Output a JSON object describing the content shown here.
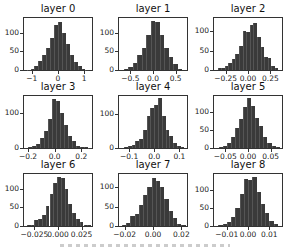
{
  "figure": {
    "layout": "3x3 grid of histograms",
    "bar_color": "#3a3a3a"
  },
  "chart_data": [
    {
      "type": "bar",
      "title": "layer 0",
      "xticks": [
        "−1",
        "0",
        "1"
      ],
      "xtick_values": [
        -1,
        0,
        1
      ],
      "xlim": [
        -1.3,
        1.3
      ],
      "yticks": [
        "0",
        "50",
        "100"
      ],
      "ytick_values": [
        0,
        50,
        100
      ],
      "ylim": [
        0,
        140
      ],
      "bins": [
        -1.2,
        -1.05,
        -0.9,
        -0.75,
        -0.6,
        -0.45,
        -0.3,
        -0.15,
        0.0,
        0.15,
        0.3,
        0.45,
        0.6,
        0.75,
        0.9,
        1.05
      ],
      "values": [
        1,
        4,
        10,
        25,
        40,
        60,
        85,
        122,
        128,
        100,
        70,
        40,
        22,
        10,
        4,
        1
      ]
    },
    {
      "type": "bar",
      "title": "layer 1",
      "xticks": [
        "−0.5",
        "0.0",
        "0.5"
      ],
      "xtick_values": [
        -0.5,
        0,
        0.5
      ],
      "xlim": [
        -0.75,
        0.75
      ],
      "yticks": [
        "0",
        "50",
        "100"
      ],
      "ytick_values": [
        0,
        50,
        100
      ],
      "ylim": [
        0,
        140
      ],
      "bins": [
        -0.65,
        -0.55,
        -0.45,
        -0.35,
        -0.25,
        -0.15,
        -0.05,
        0.05,
        0.15,
        0.25,
        0.35,
        0.45,
        0.55
      ],
      "values": [
        3,
        8,
        20,
        40,
        60,
        95,
        132,
        130,
        95,
        60,
        35,
        15,
        4
      ]
    },
    {
      "type": "bar",
      "title": "layer 2",
      "xticks": [
        "−0.25",
        "0.00",
        "0.25"
      ],
      "xtick_values": [
        -0.25,
        0,
        0.25
      ],
      "xlim": [
        -0.38,
        0.38
      ],
      "yticks": [
        "0",
        "50",
        "100"
      ],
      "ytick_values": [
        0,
        50,
        100
      ],
      "ylim": [
        0,
        135
      ],
      "bins": [
        -0.34,
        -0.3,
        -0.26,
        -0.22,
        -0.18,
        -0.14,
        -0.1,
        -0.06,
        -0.02,
        0.02,
        0.06,
        0.1,
        0.14,
        0.18,
        0.22,
        0.26,
        0.3
      ],
      "values": [
        5,
        6,
        10,
        18,
        28,
        42,
        62,
        100,
        98,
        118,
        122,
        85,
        60,
        35,
        30,
        10,
        4
      ]
    },
    {
      "type": "bar",
      "title": "layer 3",
      "xticks": [
        "−0.2",
        "0.0",
        "0.2"
      ],
      "xtick_values": [
        -0.2,
        0,
        0.2
      ],
      "xlim": [
        -0.23,
        0.28
      ],
      "yticks": [
        "0",
        "100"
      ],
      "ytick_values": [
        0,
        100
      ],
      "ylim": [
        0,
        150
      ],
      "bins": [
        -0.2,
        -0.17,
        -0.14,
        -0.11,
        -0.08,
        -0.05,
        -0.02,
        0.01,
        0.04,
        0.07,
        0.1,
        0.13,
        0.16,
        0.19,
        0.22,
        0.25
      ],
      "values": [
        3,
        5,
        12,
        30,
        50,
        85,
        140,
        135,
        100,
        65,
        35,
        20,
        6,
        2,
        3,
        1
      ]
    },
    {
      "type": "bar",
      "title": "layer 4",
      "xticks": [
        "−0.1",
        "0.0",
        "0.1"
      ],
      "xtick_values": [
        -0.1,
        0,
        0.1
      ],
      "xlim": [
        -0.14,
        0.13
      ],
      "yticks": [
        "0",
        "100"
      ],
      "ytick_values": [
        0,
        100
      ],
      "ylim": [
        0,
        155
      ],
      "bins": [
        -0.12,
        -0.105,
        -0.09,
        -0.075,
        -0.06,
        -0.045,
        -0.03,
        -0.015,
        0.0,
        0.015,
        0.03,
        0.045,
        0.06,
        0.075,
        0.09,
        0.105
      ],
      "values": [
        2,
        5,
        10,
        20,
        28,
        55,
        95,
        120,
        128,
        150,
        95,
        55,
        35,
        15,
        5,
        2
      ]
    },
    {
      "type": "bar",
      "title": "layer 5",
      "xticks": [
        "−0.05",
        "0.00",
        "0.05"
      ],
      "xtick_values": [
        -0.05,
        0,
        0.05
      ],
      "xlim": [
        -0.075,
        0.075
      ],
      "yticks": [
        "0",
        "50",
        "100"
      ],
      "ytick_values": [
        0,
        50,
        100
      ],
      "ylim": [
        0,
        145
      ],
      "bins": [
        -0.065,
        -0.056,
        -0.047,
        -0.038,
        -0.029,
        -0.02,
        -0.011,
        -0.002,
        0.007,
        0.016,
        0.025,
        0.034,
        0.043,
        0.052,
        0.061
      ],
      "values": [
        2,
        6,
        14,
        30,
        55,
        80,
        115,
        140,
        118,
        85,
        60,
        32,
        15,
        5,
        2
      ]
    },
    {
      "type": "bar",
      "title": "layer 6",
      "xticks": [
        "−0.025",
        "0.000",
        "0.025"
      ],
      "xtick_values": [
        -0.025,
        0,
        0.025
      ],
      "xlim": [
        -0.036,
        0.036
      ],
      "yticks": [
        "0",
        "50",
        "100"
      ],
      "ytick_values": [
        0,
        50,
        100
      ],
      "ylim": [
        0,
        140
      ],
      "bins": [
        -0.033,
        -0.029,
        -0.025,
        -0.021,
        -0.017,
        -0.013,
        -0.009,
        -0.005,
        -0.001,
        0.003,
        0.007,
        0.011,
        0.015,
        0.019,
        0.023,
        0.027,
        0.031
      ],
      "values": [
        2,
        3,
        15,
        18,
        30,
        55,
        85,
        115,
        132,
        128,
        100,
        60,
        35,
        20,
        10,
        3,
        2
      ]
    },
    {
      "type": "bar",
      "title": "layer 7",
      "xticks": [
        "−0.02",
        "0.00",
        "0.02"
      ],
      "xtick_values": [
        -0.02,
        0,
        0.02
      ],
      "xlim": [
        -0.024,
        0.024
      ],
      "yticks": [
        "0",
        "50",
        "100"
      ],
      "ytick_values": [
        0,
        50,
        100
      ],
      "ylim": [
        0,
        135
      ],
      "bins": [
        -0.022,
        -0.019,
        -0.016,
        -0.013,
        -0.01,
        -0.007,
        -0.004,
        -0.001,
        0.002,
        0.005,
        0.008,
        0.011,
        0.014,
        0.017,
        0.02
      ],
      "values": [
        2,
        8,
        25,
        30,
        55,
        80,
        100,
        125,
        118,
        100,
        70,
        40,
        20,
        6,
        2
      ]
    },
    {
      "type": "bar",
      "title": "layer 8",
      "xticks": [
        "−0.01",
        "0.00",
        "0.01"
      ],
      "xtick_values": [
        -0.01,
        0,
        0.01
      ],
      "xlim": [
        -0.016,
        0.016
      ],
      "yticks": [
        "0",
        "50",
        "100"
      ],
      "ytick_values": [
        0,
        50,
        100
      ],
      "ylim": [
        0,
        145
      ],
      "bins": [
        -0.014,
        -0.012,
        -0.01,
        -0.008,
        -0.006,
        -0.004,
        -0.002,
        0.0,
        0.002,
        0.004,
        0.006,
        0.008,
        0.01,
        0.012
      ],
      "values": [
        2,
        5,
        12,
        25,
        50,
        90,
        130,
        128,
        138,
        95,
        60,
        35,
        15,
        5
      ]
    }
  ]
}
